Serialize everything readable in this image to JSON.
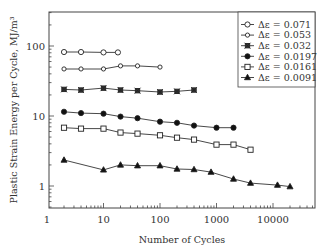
{
  "chart_data": {
    "type": "line",
    "title": "",
    "xlabel": "Number of Cycles",
    "ylabel": "Plastic Strain Energy per Cycle, MJ/m³",
    "xscale": "log",
    "yscale": "log",
    "xlim": [
      1,
      50000
    ],
    "ylim": [
      0.47,
      300
    ],
    "x_ticks": [
      1,
      10,
      100,
      1000,
      10000
    ],
    "x_tick_labels": [
      "1",
      "10",
      "100",
      "1000",
      "10000"
    ],
    "y_ticks": [
      1,
      10,
      100
    ],
    "y_tick_labels": [
      "1",
      "10",
      "100"
    ],
    "grid": false,
    "legend_position": "upper right",
    "series": [
      {
        "name": "Δε = 0.071",
        "marker": "open-circle",
        "x": [
          2,
          4,
          10,
          18
        ],
        "y": [
          82,
          82,
          81,
          81
        ]
      },
      {
        "name": "Δε = 0.053",
        "marker": "open-diamond",
        "x": [
          2,
          4,
          10,
          20,
          40,
          100
        ],
        "y": [
          47,
          47,
          47,
          52,
          52,
          50
        ]
      },
      {
        "name": "Δε = 0.032",
        "marker": "asterisk-square",
        "x": [
          2,
          4,
          10,
          20,
          40,
          100,
          200,
          400
        ],
        "y": [
          24,
          23.5,
          25,
          23.5,
          23,
          22,
          22.5,
          23.5
        ]
      },
      {
        "name": "Δε = 0.0197",
        "marker": "filled-circle",
        "x": [
          2,
          4,
          10,
          20,
          40,
          100,
          200,
          400,
          1000,
          2000
        ],
        "y": [
          11.5,
          11,
          10.8,
          9.8,
          9.3,
          8.3,
          8,
          7.3,
          6.8,
          6.8
        ]
      },
      {
        "name": "Δε = 0.0161",
        "marker": "open-square",
        "x": [
          2,
          4,
          10,
          20,
          40,
          100,
          200,
          400,
          1000,
          2000,
          4000
        ],
        "y": [
          6.8,
          6.6,
          6.6,
          5.8,
          5.6,
          5.3,
          4.9,
          4.6,
          3.9,
          3.9,
          3.3
        ]
      },
      {
        "name": "Δε = 0.0091",
        "marker": "filled-triangle",
        "x": [
          2,
          10,
          20,
          40,
          100,
          200,
          400,
          800,
          2000,
          4000,
          12000,
          20000
        ],
        "y": [
          2.35,
          1.7,
          2.0,
          1.95,
          1.95,
          1.75,
          1.72,
          1.58,
          1.26,
          1.1,
          1.03,
          0.98
        ]
      }
    ]
  }
}
